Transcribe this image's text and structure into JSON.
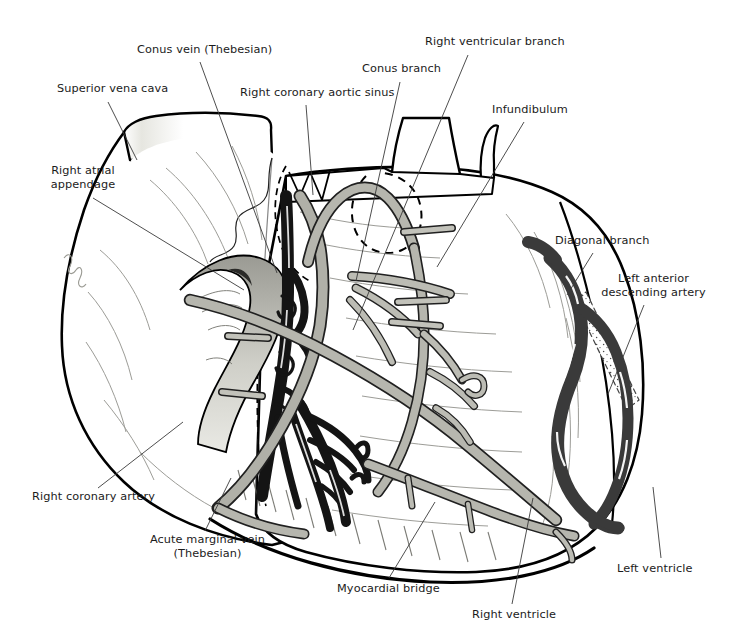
{
  "figure": {
    "width": 729,
    "height": 643,
    "background": "#ffffff"
  },
  "palette": {
    "ink": "#111111",
    "outline": "#000000",
    "artery_fill": "#b0b0a8",
    "artery_fill_light": "#c3c3bb",
    "vein_fill": "#1a1a1a",
    "lad_fill": "#3b3b3b",
    "muscle_shade": "#d8d8d2",
    "leader_line": "#444444",
    "label_text": "#1b1b1b"
  },
  "labels": [
    {
      "id": "superior-vena-cava",
      "text": "Superior vena cava",
      "x": 57,
      "y": 82,
      "align": "left",
      "leader": {
        "x1": 108,
        "y1": 102,
        "x2": 137,
        "y2": 160
      }
    },
    {
      "id": "conus-vein-thebesian",
      "text": "Conus vein (Thebesian)",
      "x": 137,
      "y": 43,
      "align": "left",
      "leader": {
        "x1": 200,
        "y1": 62,
        "x2": 277,
        "y2": 273
      }
    },
    {
      "id": "right-coronary-aortic-sinus",
      "text": "Right coronary aortic sinus",
      "x": 240,
      "y": 86,
      "align": "left",
      "leader": {
        "x1": 306,
        "y1": 105,
        "x2": 313,
        "y2": 195
      }
    },
    {
      "id": "conus-branch",
      "text": "Conus branch",
      "x": 362,
      "y": 62,
      "align": "left",
      "leader": {
        "x1": 400,
        "y1": 82,
        "x2": 356,
        "y2": 281
      }
    },
    {
      "id": "right-ventricular-branch",
      "text": "Right ventricular branch",
      "x": 425,
      "y": 35,
      "align": "left",
      "leader": {
        "x1": 468,
        "y1": 55,
        "x2": 353,
        "y2": 330
      }
    },
    {
      "id": "infundibulum",
      "text": "Infundibulum",
      "x": 492,
      "y": 103,
      "align": "left",
      "leader": {
        "x1": 524,
        "y1": 122,
        "x2": 437,
        "y2": 267
      }
    },
    {
      "id": "right-atrial-appendage",
      "text": "Right atrial appendage",
      "x": 40,
      "y": 164,
      "align": "left",
      "width": 86,
      "leader": {
        "x1": 93,
        "y1": 198,
        "x2": 244,
        "y2": 290
      }
    },
    {
      "id": "diagonal-branch",
      "text": "Diagonal branch",
      "x": 555,
      "y": 234,
      "align": "left",
      "leader": {
        "x1": 593,
        "y1": 253,
        "x2": 567,
        "y2": 295
      }
    },
    {
      "id": "left-anterior-descending-artery",
      "text": "Left anterior descending artery",
      "x": 601,
      "y": 272,
      "align": "left",
      "width": 105,
      "leader": {
        "x1": 644,
        "y1": 305,
        "x2": 608,
        "y2": 394
      }
    },
    {
      "id": "right-coronary-artery",
      "text": "Right coronary artery",
      "x": 32,
      "y": 490,
      "align": "left",
      "leader": {
        "x1": 98,
        "y1": 488,
        "x2": 183,
        "y2": 422
      }
    },
    {
      "id": "acute-marginal-vein-thebesian",
      "text": "Acute marginal vein",
      "text2": "(Thebesian)",
      "x": 145,
      "y": 533,
      "align": "left",
      "leader": {
        "x1": 205,
        "y1": 531,
        "x2": 231,
        "y2": 478
      }
    },
    {
      "id": "myocardial-bridge",
      "text": "Myocardial bridge",
      "x": 337,
      "y": 582,
      "align": "left",
      "leader": {
        "x1": 389,
        "y1": 578,
        "x2": 435,
        "y2": 502
      }
    },
    {
      "id": "right-ventricle",
      "text": "Right ventricle",
      "x": 472,
      "y": 608,
      "align": "left",
      "leader": {
        "x1": 512,
        "y1": 604,
        "x2": 533,
        "y2": 498
      }
    },
    {
      "id": "left-ventricle",
      "text": "Left ventricle",
      "x": 617,
      "y": 562,
      "align": "left",
      "leader": {
        "x1": 661,
        "y1": 558,
        "x2": 653,
        "y2": 487
      }
    }
  ],
  "structures": [
    {
      "id": "right-atrium-body",
      "name": "Right atrium / right atrial appendage"
    },
    {
      "id": "superior-vena-cava-trunk",
      "name": "Superior vena cava"
    },
    {
      "id": "aorta-root",
      "name": "Aortic root with right coronary aortic sinus"
    },
    {
      "id": "pulmonary-trunk",
      "name": "Pulmonary trunk"
    },
    {
      "id": "right-ventricle-body",
      "name": "Right ventricle anterior wall"
    },
    {
      "id": "left-ventricle-body",
      "name": "Left ventricle anterior wall"
    },
    {
      "id": "right-coronary-artery-vessel",
      "name": "Right coronary artery"
    },
    {
      "id": "conus-branch-vessel",
      "name": "Conus branch"
    },
    {
      "id": "right-ventricular-branch-vessel",
      "name": "Right ventricular branch"
    },
    {
      "id": "acute-marginal-artery-vessel",
      "name": "Acute marginal artery"
    },
    {
      "id": "lad-vessel",
      "name": "Left anterior descending artery"
    },
    {
      "id": "diagonal-branch-vessel",
      "name": "Diagonal branch"
    },
    {
      "id": "conus-vein-vessel",
      "name": "Conus vein (Thebesian)"
    },
    {
      "id": "acute-marginal-vein-vessel",
      "name": "Acute marginal vein (Thebesian)"
    },
    {
      "id": "myocardial-bridge-region",
      "name": "Myocardial bridge over the LAD"
    }
  ]
}
